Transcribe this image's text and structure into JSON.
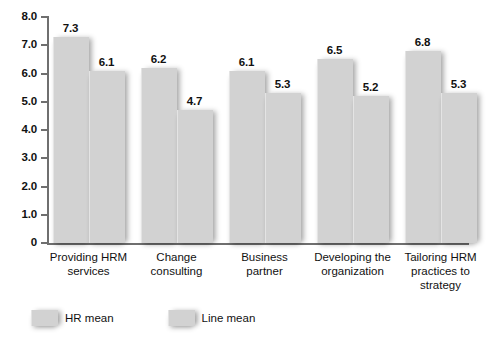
{
  "chart_data": {
    "type": "bar",
    "title": "",
    "subtitle": "",
    "xlabel": "",
    "ylabel": "",
    "ylim": [
      0,
      8.0
    ],
    "grid": false,
    "legend_position": "bottom-left",
    "y_ticks": [
      "0",
      "1.0",
      "2.0",
      "3.0",
      "4.0",
      "5.0",
      "6.0",
      "7.0",
      "8.0"
    ],
    "y_tick_values": [
      0,
      1.0,
      2.0,
      3.0,
      4.0,
      5.0,
      6.0,
      7.0,
      8.0
    ],
    "categories": [
      "Providing HRM services",
      "Change consulting",
      "Business partner",
      "Developing the organization",
      "Tailoring HRM practices to strategy"
    ],
    "category_lines": [
      [
        "Providing HRM",
        "services"
      ],
      [
        "Change",
        "consulting"
      ],
      [
        "Business",
        "partner"
      ],
      [
        "Developing the",
        "organization"
      ],
      [
        "Tailoring HRM",
        "practices to",
        "strategy"
      ]
    ],
    "series": [
      {
        "name": "HR mean",
        "color": "#d2d2d2",
        "values": [
          7.3,
          6.2,
          6.1,
          6.5,
          6.8
        ],
        "labels": [
          "7.3",
          "6.2",
          "6.1",
          "6.5",
          "6.8"
        ]
      },
      {
        "name": "Line mean",
        "color": "#d2d2d2",
        "values": [
          6.1,
          4.7,
          5.3,
          5.2,
          5.3
        ],
        "labels": [
          "6.1",
          "4.7",
          "5.3",
          "5.2",
          "5.3"
        ]
      }
    ]
  },
  "legend": {
    "items": [
      {
        "label": "HR mean"
      },
      {
        "label": "Line mean"
      }
    ]
  },
  "colors": {
    "bar_fill": "#d2d2d2",
    "axis": "#6f6f6f",
    "text": "#111111",
    "background": "#ffffff"
  }
}
